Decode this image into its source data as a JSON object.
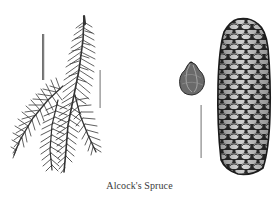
{
  "illustration": {
    "caption": "Alcock's Spruce",
    "subjects": [
      {
        "name": "branch-with-needles",
        "icon": "spruce-branch-icon"
      },
      {
        "name": "seed",
        "icon": "seed-icon"
      },
      {
        "name": "cone",
        "icon": "pine-cone-icon"
      }
    ],
    "scale_bars": 3,
    "colors": {
      "background": "#ffffff",
      "ink": "#2b2b2b",
      "ink_light": "#777777",
      "cone_highlight": "#e8e8e8"
    }
  }
}
